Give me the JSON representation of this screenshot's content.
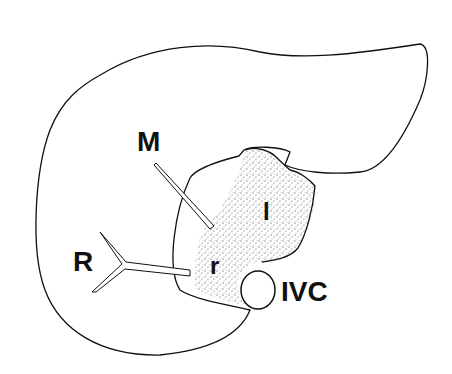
{
  "diagram": {
    "labels": {
      "middle_vein": "M",
      "right_vein": "R",
      "left_caudate": "l",
      "right_caudate": "r",
      "ivc": "IVC"
    },
    "colors": {
      "outline": "#111111",
      "background": "#ffffff",
      "stipple": "#333333"
    }
  }
}
